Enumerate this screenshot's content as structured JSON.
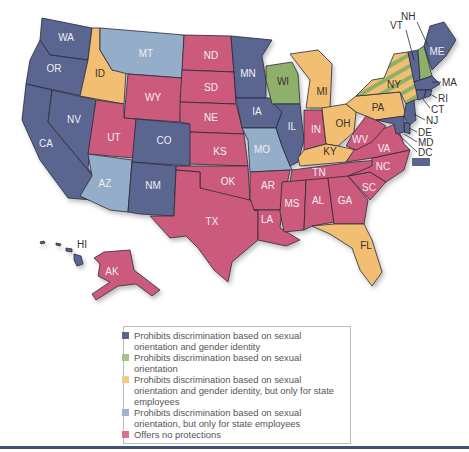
{
  "colors": {
    "orientation_and_gender": "#5a6590",
    "orientation_only": "#8fb06b",
    "state_employees_orientation_and_gender": "#f2bf72",
    "state_employees_orientation": "#94adc9",
    "no_protections": "#cc5a7c",
    "rule": "#3d5276"
  },
  "legend": {
    "items": [
      {
        "key": "orientation_and_gender",
        "color": "#5a6590",
        "label": "Prohibits discrimination based on sexual orientation and gender identity"
      },
      {
        "key": "orientation_only",
        "color": "#a8c08a",
        "label": "Prohibits discrimination based on sexual orientation"
      },
      {
        "key": "state_employees_orientation_and_gender",
        "color": "#f5c98a",
        "label": "Prohibits discrimination based on sexual orientation and gender identity, but only for state employees"
      },
      {
        "key": "state_employees_orientation",
        "color": "#9db3cf",
        "label": "Prohibits discrimination based on sexual orientation, but only for state employees"
      },
      {
        "key": "no_protections",
        "color": "#d8708e",
        "label": "Offers no protections"
      }
    ]
  },
  "states": {
    "WA": {
      "label": "WA",
      "category": "orientation_and_gender"
    },
    "OR": {
      "label": "OR",
      "category": "orientation_and_gender"
    },
    "CA": {
      "label": "CA",
      "category": "orientation_and_gender"
    },
    "NV": {
      "label": "NV",
      "category": "orientation_and_gender"
    },
    "ID": {
      "label": "ID",
      "category": "state_employees_orientation_and_gender"
    },
    "MT": {
      "label": "MT",
      "category": "state_employees_orientation"
    },
    "WY": {
      "label": "WY",
      "category": "no_protections"
    },
    "UT": {
      "label": "UT",
      "category": "no_protections"
    },
    "CO": {
      "label": "CO",
      "category": "orientation_and_gender"
    },
    "AZ": {
      "label": "AZ",
      "category": "state_employees_orientation"
    },
    "NM": {
      "label": "NM",
      "category": "orientation_and_gender"
    },
    "ND": {
      "label": "ND",
      "category": "no_protections"
    },
    "SD": {
      "label": "SD",
      "category": "no_protections"
    },
    "NE": {
      "label": "NE",
      "category": "no_protections"
    },
    "KS": {
      "label": "KS",
      "category": "no_protections"
    },
    "OK": {
      "label": "OK",
      "category": "no_protections"
    },
    "TX": {
      "label": "TX",
      "category": "no_protections"
    },
    "MN": {
      "label": "MN",
      "category": "orientation_and_gender"
    },
    "IA": {
      "label": "IA",
      "category": "orientation_and_gender"
    },
    "MO": {
      "label": "MO",
      "category": "state_employees_orientation"
    },
    "AR": {
      "label": "AR",
      "category": "no_protections"
    },
    "LA": {
      "label": "LA",
      "category": "no_protections"
    },
    "WI": {
      "label": "WI",
      "category": "orientation_only"
    },
    "IL": {
      "label": "IL",
      "category": "orientation_and_gender"
    },
    "MI": {
      "label": "MI",
      "category": "state_employees_orientation_and_gender"
    },
    "IN": {
      "label": "IN",
      "category": "no_protections"
    },
    "OH": {
      "label": "OH",
      "category": "state_employees_orientation_and_gender"
    },
    "KY": {
      "label": "KY",
      "category": "state_employees_orientation_and_gender"
    },
    "TN": {
      "label": "TN",
      "category": "no_protections"
    },
    "MS": {
      "label": "MS",
      "category": "no_protections"
    },
    "AL": {
      "label": "AL",
      "category": "no_protections"
    },
    "GA": {
      "label": "GA",
      "category": "no_protections"
    },
    "FL": {
      "label": "FL",
      "category": "state_employees_orientation_and_gender"
    },
    "SC": {
      "label": "SC",
      "category": "no_protections"
    },
    "NC": {
      "label": "NC",
      "category": "no_protections"
    },
    "VA": {
      "label": "VA",
      "category": "no_protections"
    },
    "WV": {
      "label": "WV",
      "category": "no_protections"
    },
    "PA": {
      "label": "PA",
      "category": "state_employees_orientation_and_gender"
    },
    "NY": {
      "label": "NY",
      "category": "orientation_only + state_employees_orientation_and_gender (striped)"
    },
    "VT": {
      "label": "VT",
      "category": "orientation_and_gender"
    },
    "NH": {
      "label": "NH",
      "category": "orientation_only"
    },
    "ME": {
      "label": "ME",
      "category": "orientation_and_gender"
    },
    "MA": {
      "label": "MA",
      "category": "orientation_and_gender"
    },
    "RI": {
      "label": "RI",
      "category": "orientation_and_gender"
    },
    "CT": {
      "label": "CT",
      "category": "orientation_and_gender"
    },
    "NJ": {
      "label": "NJ",
      "category": "orientation_and_gender"
    },
    "DE": {
      "label": "DE",
      "category": "orientation_and_gender"
    },
    "MD": {
      "label": "MD",
      "category": "orientation_and_gender"
    },
    "DC": {
      "label": "DC",
      "category": "orientation_and_gender"
    },
    "HI": {
      "label": "HI",
      "category": "orientation_and_gender"
    },
    "AK": {
      "label": "AK",
      "category": "no_protections"
    }
  }
}
